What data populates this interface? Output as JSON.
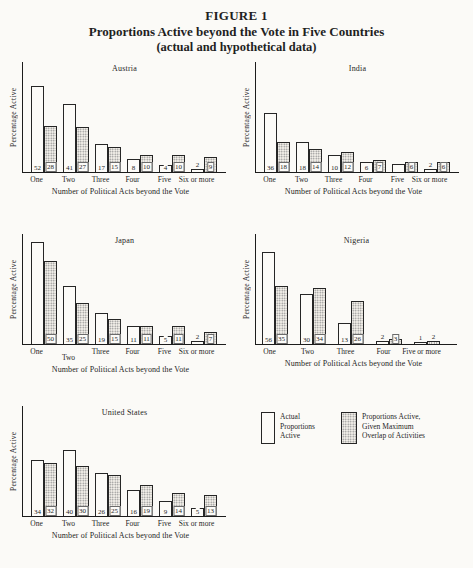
{
  "header": {
    "figure_label": "FIGURE 1",
    "title": "Proportions Active beyond the Vote in Five Countries",
    "subtitle": "(actual and hypothetical data)"
  },
  "legend": {
    "actual_label": "Actual\nProportions\nActive",
    "hypothetical_label": "Proportions Active,\nGiven Maximum\nOverlap of Activities"
  },
  "colors": {
    "ink": "#1f1f1f",
    "paper": "#fbfaf7",
    "stipple_dot": "#868686",
    "stipple_bg": "#f3f0ea"
  },
  "chart_data": [
    {
      "type": "bar",
      "title": "Austria",
      "ylabel": "Percentage Active",
      "xlabel": "Number of Political Acts beyond the Vote",
      "categories": [
        "One",
        "Two",
        "Three",
        "Four",
        "Five",
        "Six or more"
      ],
      "series": [
        {
          "name": "Actual Proportions Active",
          "values": [
            52,
            41,
            17,
            8,
            4,
            2
          ],
          "labels": [
            "52",
            "41",
            "17",
            "8",
            "4",
            "2"
          ]
        },
        {
          "name": "Proportions Active, Given Maximum Overlap of Activities",
          "values": [
            28,
            27,
            15,
            10,
            10,
            9
          ],
          "labels": [
            "28",
            "27",
            "15",
            "10",
            "10",
            "9"
          ]
        }
      ]
    },
    {
      "type": "bar",
      "title": "India",
      "ylabel": "Percentage Active",
      "xlabel": "Number of Political Acts beyond the Vote",
      "categories": [
        "One",
        "Two",
        "Three",
        "Four",
        "Five",
        "Six or more"
      ],
      "series": [
        {
          "name": "Actual Proportions Active",
          "values": [
            36,
            18,
            10,
            6,
            5,
            2
          ],
          "labels": [
            "36",
            "18",
            "10",
            "6",
            "",
            "2"
          ]
        },
        {
          "name": "Proportions Active, Given Maximum Overlap of Activities",
          "values": [
            18,
            14,
            12,
            7,
            6,
            6
          ],
          "labels": [
            "18",
            "14",
            "12",
            "7",
            "6",
            "6"
          ]
        }
      ],
      "note": "Five-actual bar has no printed number in the scan; height ~5"
    },
    {
      "type": "bar",
      "title": "Japan",
      "ylabel": "Percentage Active",
      "xlabel": "Number of Political Acts beyond the Vote",
      "categories": [
        "One",
        "Two",
        "Three",
        "Four",
        "Five",
        "Six or more"
      ],
      "series": [
        {
          "name": "Actual Proportions Active",
          "values": [
            62,
            35,
            19,
            11,
            5,
            2
          ],
          "labels": [
            "",
            "35",
            "19",
            "11",
            "5",
            "2"
          ]
        },
        {
          "name": "Proportions Active, Given Maximum Overlap of Activities",
          "values": [
            50,
            25,
            15,
            11,
            11,
            7
          ],
          "labels": [
            "50",
            "25",
            "15",
            "11",
            "11",
            "7"
          ]
        }
      ],
      "note": "One-actual bar has no printed number in the scan; height ~62"
    },
    {
      "type": "bar",
      "title": "Nigeria",
      "ylabel": "Percentage Active",
      "xlabel": "Number of Political Acts beyond the Vote",
      "categories": [
        "One",
        "Two",
        "Three",
        "Four",
        "Five or more"
      ],
      "series": [
        {
          "name": "Actual Proportions Active",
          "values": [
            56,
            30,
            13,
            2,
            1
          ],
          "labels": [
            "56",
            "30",
            "13",
            "2",
            "1"
          ]
        },
        {
          "name": "Proportions Active, Given Maximum Overlap of Activities",
          "values": [
            35,
            34,
            26,
            3,
            2
          ],
          "labels": [
            "35",
            "34",
            "26",
            "3",
            "2"
          ]
        }
      ]
    },
    {
      "type": "bar",
      "title": "United States",
      "ylabel": "Percentage Active",
      "xlabel": "Number of Political Acts beyond the Vote",
      "categories": [
        "One",
        "Two",
        "Three",
        "Four",
        "Five",
        "Six or more"
      ],
      "series": [
        {
          "name": "Actual Proportions Active",
          "values": [
            34,
            40,
            26,
            16,
            9,
            5
          ],
          "labels": [
            "34",
            "40",
            "26",
            "16",
            "9",
            "5"
          ]
        },
        {
          "name": "Proportions Active, Given Maximum Overlap of Activities",
          "values": [
            32,
            30,
            25,
            19,
            14,
            13
          ],
          "labels": [
            "32",
            "30",
            "25",
            "19",
            "14",
            "13"
          ]
        }
      ]
    }
  ]
}
